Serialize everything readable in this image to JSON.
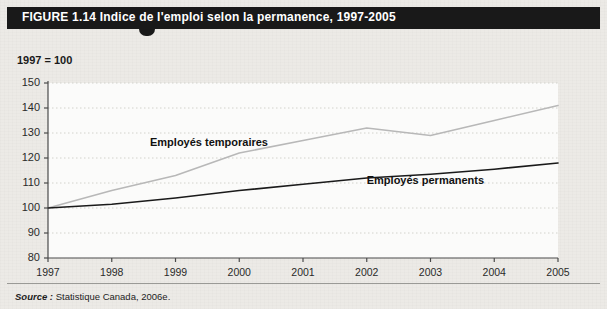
{
  "figure": {
    "header_label": "FIGURE 1.14",
    "header_title": "Indice de l'emploi selon la permanence, 1997-2005",
    "header_full": "FIGURE 1.14   Indice de l'emploi selon la permanence, 1997-2005",
    "axis_note": "1997 = 100",
    "source_prefix": "Source :",
    "source_text": "Statistique Canada, 2006e.",
    "colors": {
      "header_bar": "#191919",
      "page_background": "#eceae6",
      "plot_background": "#fbfbfa",
      "gridline": "#d2d2cc",
      "axis": "#4a4a4a",
      "series_temporary": "#b8b8b8",
      "series_permanent": "#1a1a1a",
      "rule": "#9a9a96"
    }
  },
  "chart_data": {
    "type": "line",
    "title": "Indice de l'emploi selon la permanence, 1997-2005",
    "subtitle": "1997 = 100",
    "xlabel": "",
    "ylabel": "",
    "x": [
      1997,
      1998,
      1999,
      2000,
      2001,
      2002,
      2003,
      2004,
      2005
    ],
    "categories": [
      "1997",
      "1998",
      "1999",
      "2000",
      "2001",
      "2002",
      "2003",
      "2004",
      "2005"
    ],
    "xlim": [
      1997,
      2005
    ],
    "ylim": [
      80,
      150
    ],
    "yticks": [
      80,
      90,
      100,
      110,
      120,
      130,
      140,
      150
    ],
    "ytick_labels": [
      "80",
      "90",
      "100",
      "110",
      "120",
      "130",
      "140",
      "150"
    ],
    "grid": true,
    "grid_style": "dotted-horizontal",
    "legend": "inline-annotations",
    "series": [
      {
        "name": "Employés temporaires",
        "color": "#b8b8b8",
        "values": [
          100,
          107,
          113,
          122,
          127,
          132,
          129,
          135,
          141
        ]
      },
      {
        "name": "Employés permanents",
        "color": "#1a1a1a",
        "values": [
          100,
          101.5,
          104,
          107,
          109.5,
          112,
          113.5,
          115.5,
          118
        ]
      }
    ],
    "annotations": [
      {
        "text": "Employés temporaires",
        "x": 1998.6,
        "y": 126
      },
      {
        "text": "Employés permanents",
        "x": 2002.0,
        "y": 111
      }
    ]
  }
}
